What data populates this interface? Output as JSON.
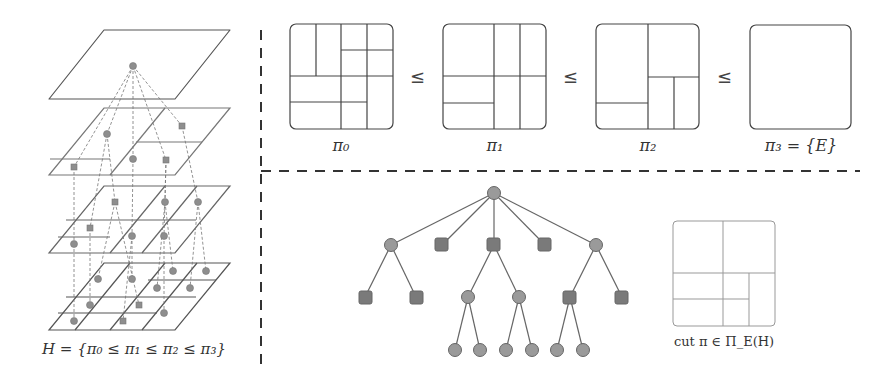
{
  "figure": {
    "left_panel": {
      "caption": "H = {π₀ ≤ π₁ ≤ π₂ ≤ π₃}",
      "layers": 4
    },
    "top_right_panel": {
      "partitions": [
        {
          "label": "π₀"
        },
        {
          "label": "π₁"
        },
        {
          "label": "π₂"
        },
        {
          "label": "π₃ = {E}"
        }
      ],
      "relation_symbol": "≤"
    },
    "bottom_right_panel": {
      "tree": {
        "root": "circle",
        "level1": [
          "circle",
          "square",
          "square",
          "square",
          "circle"
        ],
        "level2": [
          "square",
          "square",
          "circle",
          "circle",
          "square",
          "square"
        ],
        "level3": [
          "circle",
          "circle",
          "circle",
          "circle",
          "circle",
          "circle"
        ]
      },
      "cut_caption": "cut π ∈ Π_E(H)"
    },
    "colors": {
      "node_fill_circle": "#9a9a9a",
      "node_fill_square": "#7a7a7a",
      "stroke": "#444444",
      "divider": "#333333"
    }
  }
}
